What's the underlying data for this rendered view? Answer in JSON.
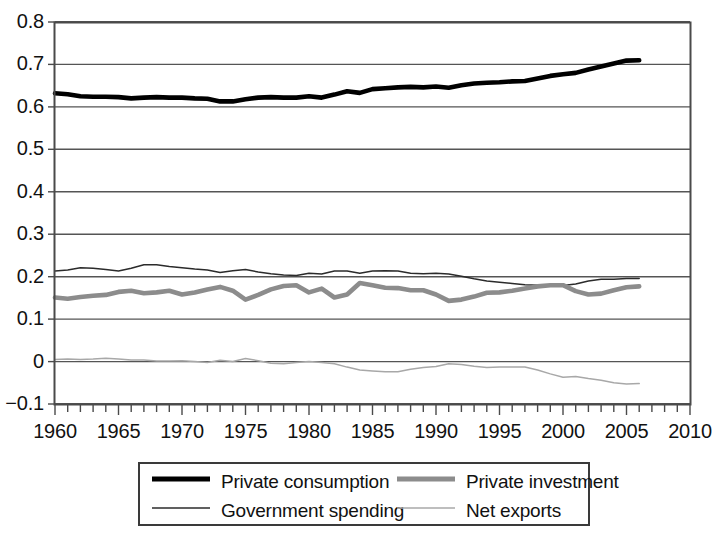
{
  "chart_data": {
    "type": "line",
    "title": "",
    "xlabel": "",
    "ylabel": "",
    "xlim": [
      1960,
      2010
    ],
    "ylim": [
      -0.1,
      0.8
    ],
    "grid": true,
    "grid_axis": "y",
    "legend_position": "bottom",
    "x_tick_labels": [
      "1960",
      "1965",
      "1970",
      "1975",
      "1980",
      "1985",
      "1990",
      "1995",
      "2000",
      "2005",
      "2010"
    ],
    "x_tick_values": [
      1960,
      1965,
      1970,
      1975,
      1980,
      1985,
      1990,
      1995,
      2000,
      2005,
      2010
    ],
    "x_minor_tick_interval": 1,
    "y_tick_labels": [
      "0.8",
      "0.7",
      "0.6",
      "0.5",
      "0.4",
      "0.3",
      "0.2",
      "0.1",
      "0",
      "-0.1"
    ],
    "y_tick_values": [
      0.8,
      0.7,
      0.6,
      0.5,
      0.4,
      0.3,
      0.2,
      0.1,
      0,
      -0.1
    ],
    "x": [
      1960,
      1961,
      1962,
      1963,
      1964,
      1965,
      1966,
      1967,
      1968,
      1969,
      1970,
      1971,
      1972,
      1973,
      1974,
      1975,
      1976,
      1977,
      1978,
      1979,
      1980,
      1981,
      1982,
      1983,
      1984,
      1985,
      1986,
      1987,
      1988,
      1989,
      1990,
      1991,
      1992,
      1993,
      1994,
      1995,
      1996,
      1997,
      1998,
      1999,
      2000,
      2001,
      2002,
      2003,
      2004,
      2005,
      2006
    ],
    "series": [
      {
        "name": "Private consumption",
        "color": "#000000",
        "width": 4.6,
        "values": [
          0.632,
          0.63,
          0.625,
          0.624,
          0.624,
          0.623,
          0.62,
          0.622,
          0.623,
          0.622,
          0.622,
          0.62,
          0.619,
          0.613,
          0.613,
          0.618,
          0.622,
          0.623,
          0.622,
          0.622,
          0.625,
          0.622,
          0.629,
          0.637,
          0.633,
          0.642,
          0.644,
          0.646,
          0.647,
          0.646,
          0.648,
          0.645,
          0.651,
          0.655,
          0.657,
          0.658,
          0.66,
          0.661,
          0.667,
          0.673,
          0.677,
          0.68,
          0.688,
          0.695,
          0.702,
          0.709,
          0.71
        ]
      },
      {
        "name": "Private investment",
        "color": "#8c8c8c",
        "width": 4.6,
        "values": [
          0.151,
          0.148,
          0.152,
          0.155,
          0.157,
          0.164,
          0.167,
          0.161,
          0.163,
          0.167,
          0.158,
          0.163,
          0.17,
          0.176,
          0.167,
          0.146,
          0.157,
          0.17,
          0.178,
          0.18,
          0.163,
          0.172,
          0.151,
          0.158,
          0.185,
          0.18,
          0.174,
          0.173,
          0.168,
          0.168,
          0.158,
          0.143,
          0.146,
          0.153,
          0.162,
          0.163,
          0.167,
          0.172,
          0.177,
          0.18,
          0.18,
          0.166,
          0.158,
          0.16,
          0.168,
          0.175,
          0.177
        ]
      },
      {
        "name": "Government spending",
        "color": "#2b2b2b",
        "width": 1.5,
        "values": [
          0.213,
          0.216,
          0.221,
          0.22,
          0.217,
          0.213,
          0.22,
          0.228,
          0.228,
          0.224,
          0.221,
          0.218,
          0.216,
          0.21,
          0.214,
          0.217,
          0.211,
          0.207,
          0.204,
          0.203,
          0.208,
          0.206,
          0.213,
          0.213,
          0.208,
          0.213,
          0.214,
          0.213,
          0.208,
          0.207,
          0.208,
          0.206,
          0.201,
          0.195,
          0.19,
          0.187,
          0.184,
          0.181,
          0.18,
          0.18,
          0.179,
          0.183,
          0.19,
          0.194,
          0.194,
          0.196,
          0.196
        ]
      },
      {
        "name": "Net exports",
        "color": "#a8a8a8",
        "width": 1.5,
        "values": [
          0.005,
          0.006,
          0.005,
          0.006,
          0.008,
          0.006,
          0.004,
          0.004,
          0.001,
          0.001,
          0.002,
          0.0,
          -0.002,
          0.003,
          0.0,
          0.007,
          0.002,
          -0.004,
          -0.005,
          -0.002,
          0.0,
          -0.002,
          -0.005,
          -0.013,
          -0.02,
          -0.022,
          -0.024,
          -0.024,
          -0.018,
          -0.014,
          -0.012,
          -0.005,
          -0.007,
          -0.011,
          -0.014,
          -0.013,
          -0.013,
          -0.013,
          -0.02,
          -0.029,
          -0.037,
          -0.035,
          -0.04,
          -0.044,
          -0.05,
          -0.053,
          -0.052
        ]
      }
    ],
    "legend": [
      {
        "label": "Private consumption",
        "color": "#000000",
        "width": 5
      },
      {
        "label": "Private investment",
        "color": "#8c8c8c",
        "width": 5
      },
      {
        "label": "Government spending",
        "color": "#2b2b2b",
        "width": 1.6
      },
      {
        "label": "Net exports",
        "color": "#a8a8a8",
        "width": 1.6
      }
    ]
  },
  "plot": {
    "axis_color": "#4a4a4a",
    "grid_color": "#555555",
    "background": "#ffffff"
  }
}
